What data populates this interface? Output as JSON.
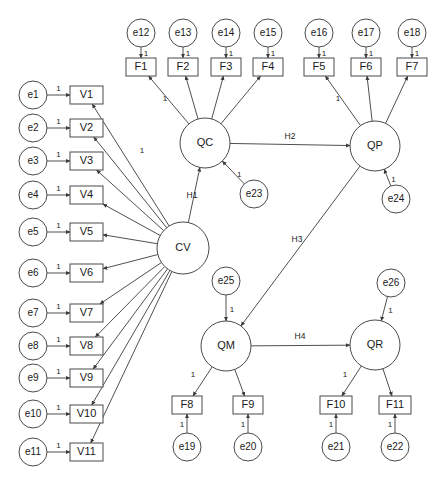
{
  "diagram": {
    "type": "sem-path-diagram",
    "colors": {
      "background": "#ffffff",
      "node_stroke": "#4a4a4a",
      "edge_stroke": "#3c3c3c",
      "text": "#1a1a1a"
    }
  },
  "latent_variables": [
    {
      "id": "CV",
      "label": "CV",
      "cx": 183,
      "cy": 248,
      "r": 26
    },
    {
      "id": "QC",
      "label": "QC",
      "cx": 205,
      "cy": 143,
      "r": 25
    },
    {
      "id": "QP",
      "label": "QP",
      "cx": 375,
      "cy": 146,
      "r": 25
    },
    {
      "id": "QM",
      "label": "QM",
      "cx": 226,
      "cy": 346,
      "r": 25
    },
    {
      "id": "QR",
      "label": "QR",
      "cx": 375,
      "cy": 345,
      "r": 25
    }
  ],
  "observed_left": [
    {
      "id": "V1",
      "label": "V1",
      "x": 70,
      "y": 86,
      "w": 33,
      "h": 18
    },
    {
      "id": "V2",
      "label": "V2",
      "x": 70,
      "y": 119,
      "w": 33,
      "h": 18
    },
    {
      "id": "V3",
      "label": "V3",
      "x": 70,
      "y": 152,
      "w": 33,
      "h": 18
    },
    {
      "id": "V4",
      "label": "V4",
      "x": 70,
      "y": 186,
      "w": 33,
      "h": 18
    },
    {
      "id": "V5",
      "label": "V5",
      "x": 70,
      "y": 223,
      "w": 33,
      "h": 18
    },
    {
      "id": "V6",
      "label": "V6",
      "x": 70,
      "y": 264,
      "w": 33,
      "h": 18
    },
    {
      "id": "V7",
      "label": "V7",
      "x": 70,
      "y": 304,
      "w": 33,
      "h": 18
    },
    {
      "id": "V8",
      "label": "V8",
      "x": 70,
      "y": 337,
      "w": 33,
      "h": 18
    },
    {
      "id": "V9",
      "label": "V9",
      "x": 70,
      "y": 369,
      "w": 33,
      "h": 18
    },
    {
      "id": "V10",
      "label": "V10",
      "x": 70,
      "y": 405,
      "w": 33,
      "h": 18
    },
    {
      "id": "V11",
      "label": "V11",
      "x": 70,
      "y": 443,
      "w": 33,
      "h": 18
    }
  ],
  "errors_left": [
    {
      "id": "e1",
      "label": "e1",
      "cx": 33,
      "cy": 95,
      "r": 14,
      "target": "V1",
      "loading": "1"
    },
    {
      "id": "e2",
      "label": "e2",
      "cx": 33,
      "cy": 128,
      "r": 14,
      "target": "V2",
      "loading": "1"
    },
    {
      "id": "e3",
      "label": "e3",
      "cx": 33,
      "cy": 161,
      "r": 14,
      "target": "V3",
      "loading": "1"
    },
    {
      "id": "e4",
      "label": "e4",
      "cx": 33,
      "cy": 195,
      "r": 14,
      "target": "V4",
      "loading": "1"
    },
    {
      "id": "e5",
      "label": "e5",
      "cx": 33,
      "cy": 232,
      "r": 14,
      "target": "V5",
      "loading": "1"
    },
    {
      "id": "e6",
      "label": "e6",
      "cx": 33,
      "cy": 273,
      "r": 14,
      "target": "V6",
      "loading": "1"
    },
    {
      "id": "e7",
      "label": "e7",
      "cx": 33,
      "cy": 313,
      "r": 14,
      "target": "V7",
      "loading": "1"
    },
    {
      "id": "e8",
      "label": "e8",
      "cx": 33,
      "cy": 346,
      "r": 14,
      "target": "V8",
      "loading": "1"
    },
    {
      "id": "e9",
      "label": "e9",
      "cx": 33,
      "cy": 378,
      "r": 14,
      "target": "V9",
      "loading": "1"
    },
    {
      "id": "e10",
      "label": "e10",
      "cx": 33,
      "cy": 414,
      "r": 14,
      "target": "V10",
      "loading": "1"
    },
    {
      "id": "e11",
      "label": "e11",
      "cx": 33,
      "cy": 452,
      "r": 14,
      "target": "V11",
      "loading": "1"
    }
  ],
  "observed_top": [
    {
      "id": "F1",
      "label": "F1",
      "x": 126,
      "y": 58,
      "w": 30,
      "h": 18,
      "latent": "QC"
    },
    {
      "id": "F2",
      "label": "F2",
      "x": 168,
      "y": 58,
      "w": 30,
      "h": 18,
      "latent": "QC"
    },
    {
      "id": "F3",
      "label": "F3",
      "x": 211,
      "y": 58,
      "w": 30,
      "h": 18,
      "latent": "QC"
    },
    {
      "id": "F4",
      "label": "F4",
      "x": 253,
      "y": 58,
      "w": 30,
      "h": 18,
      "latent": "QC"
    },
    {
      "id": "F5",
      "label": "F5",
      "x": 304,
      "y": 58,
      "w": 30,
      "h": 18,
      "latent": "QP"
    },
    {
      "id": "F6",
      "label": "F6",
      "x": 351,
      "y": 58,
      "w": 30,
      "h": 18,
      "latent": "QP"
    },
    {
      "id": "F7",
      "label": "F7",
      "x": 397,
      "y": 58,
      "w": 30,
      "h": 18,
      "latent": "QP"
    }
  ],
  "errors_top": [
    {
      "id": "e12",
      "label": "e12",
      "cx": 141,
      "cy": 33,
      "r": 14,
      "target": "F1",
      "loading": "1"
    },
    {
      "id": "e13",
      "label": "e13",
      "cx": 183,
      "cy": 33,
      "r": 14,
      "target": "F2",
      "loading": "1"
    },
    {
      "id": "e14",
      "label": "e14",
      "cx": 226,
      "cy": 33,
      "r": 14,
      "target": "F3",
      "loading": "1"
    },
    {
      "id": "e15",
      "label": "e15",
      "cx": 268,
      "cy": 33,
      "r": 14,
      "target": "F4",
      "loading": "1"
    },
    {
      "id": "e16",
      "label": "e16",
      "cx": 319,
      "cy": 33,
      "r": 14,
      "target": "F5",
      "loading": "1"
    },
    {
      "id": "e17",
      "label": "e17",
      "cx": 366,
      "cy": 33,
      "r": 14,
      "target": "F6",
      "loading": "1"
    },
    {
      "id": "e18",
      "label": "e18",
      "cx": 412,
      "cy": 33,
      "r": 14,
      "target": "F7",
      "loading": "1"
    }
  ],
  "observed_bottom": [
    {
      "id": "F8",
      "label": "F8",
      "x": 172,
      "y": 396,
      "w": 30,
      "h": 18,
      "latent": "QM"
    },
    {
      "id": "F9",
      "label": "F9",
      "x": 233,
      "y": 396,
      "w": 30,
      "h": 18,
      "latent": "QM"
    },
    {
      "id": "F10",
      "label": "F10",
      "x": 320,
      "y": 396,
      "w": 32,
      "h": 18,
      "latent": "QR"
    },
    {
      "id": "F11",
      "label": "F11",
      "x": 379,
      "y": 396,
      "w": 32,
      "h": 18,
      "latent": "QR"
    }
  ],
  "errors_bottom": [
    {
      "id": "e19",
      "label": "e19",
      "cx": 187,
      "cy": 447,
      "r": 14,
      "target": "F8",
      "loading": "1"
    },
    {
      "id": "e20",
      "label": "e20",
      "cx": 248,
      "cy": 447,
      "r": 14,
      "target": "F9",
      "loading": "1"
    },
    {
      "id": "e21",
      "label": "e21",
      "cx": 336,
      "cy": 447,
      "r": 14,
      "target": "F10",
      "loading": "1"
    },
    {
      "id": "e22",
      "label": "e22",
      "cx": 395,
      "cy": 447,
      "r": 14,
      "target": "F11",
      "loading": "1"
    }
  ],
  "errors_structural": [
    {
      "id": "e23",
      "label": "e23",
      "cx": 254,
      "cy": 194,
      "r": 14,
      "target": "QC",
      "loading": "1"
    },
    {
      "id": "e24",
      "label": "e24",
      "cx": 396,
      "cy": 199,
      "r": 14,
      "target": "QP",
      "loading": "1"
    },
    {
      "id": "e25",
      "label": "e25",
      "cx": 226,
      "cy": 281,
      "r": 14,
      "target": "QM",
      "loading": "1"
    },
    {
      "id": "e26",
      "label": "e26",
      "cx": 391,
      "cy": 283,
      "r": 14,
      "target": "QR",
      "loading": "1"
    }
  ],
  "structural_paths": [
    {
      "id": "H1",
      "label": "H1",
      "from": "CV",
      "to": "QC",
      "label_x": 192,
      "label_y": 196
    },
    {
      "id": "H2",
      "label": "H2",
      "from": "QC",
      "to": "QP",
      "label_x": 290,
      "label_y": 137
    },
    {
      "id": "H3",
      "label": "H3",
      "from": "QP",
      "to": "QM",
      "label_x": 297,
      "label_y": 240
    },
    {
      "id": "H4",
      "label": "H4",
      "from": "QM",
      "to": "QR",
      "label_x": 300,
      "label_y": 337
    }
  ],
  "fixed_loadings": [
    {
      "id": "qc-f1-loading",
      "value": "1",
      "x": 165,
      "y": 99
    },
    {
      "id": "cv-v1-loading",
      "value": "1",
      "x": 142,
      "y": 151
    },
    {
      "id": "qp-f5-loading",
      "value": "1",
      "x": 338,
      "y": 99
    },
    {
      "id": "qm-f8-loading",
      "value": "1",
      "x": 193,
      "y": 375
    },
    {
      "id": "qr-f10-loading",
      "value": "1",
      "x": 345,
      "y": 375
    }
  ],
  "icons": {
    "arrowhead": "arrow-head-icon",
    "circle_node": "latent-variable-circle-icon",
    "rect_node": "observed-variable-rectangle-icon"
  }
}
